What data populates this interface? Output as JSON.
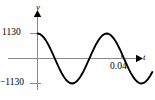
{
  "figure": {
    "name": "sinusoidal-voltage-waveform",
    "background_color": "#ffffff",
    "curve_color": "#000000",
    "axis_color": "#808080",
    "arrow_color": "#000000"
  },
  "labels": {
    "y_axis": "v",
    "x_axis": "t",
    "y_tick_positive": "1130",
    "y_tick_negative": "−1130",
    "x_tick": "0.04"
  },
  "chart_data": {
    "type": "line",
    "title": "",
    "xlabel": "t",
    "ylabel": "v",
    "amplitude": 1130,
    "waveform": "cosine",
    "phase_deg": 0,
    "period": 0.0165,
    "grid": false,
    "legend": null,
    "ylim": [
      -1130,
      1130
    ],
    "xlim": [
      0,
      0.0545
    ],
    "yticks": [
      -1130,
      1130
    ],
    "ytick_labels": [
      "−1130",
      "1130"
    ],
    "xticks": [
      0.04
    ],
    "xtick_labels": [
      "0.04"
    ],
    "cycles_shown": 2.7,
    "x": [
      0.0,
      0.00103,
      0.00206,
      0.00309,
      0.00413,
      0.00516,
      0.00619,
      0.00722,
      0.00825,
      0.00928,
      0.01031,
      0.01134,
      0.01238,
      0.01341,
      0.01444,
      0.01547,
      0.0165,
      0.01753,
      0.01856,
      0.01959,
      0.02063,
      0.02166,
      0.02269,
      0.02372,
      0.02475,
      0.02578,
      0.02681,
      0.02784,
      0.02888,
      0.02991,
      0.03094,
      0.03197,
      0.033,
      0.03403,
      0.03506,
      0.03609,
      0.03713,
      0.03816,
      0.03919,
      0.04022,
      0.04125,
      0.04228,
      0.04331,
      0.04434,
      0.04538,
      0.04641,
      0.04744,
      0.04847,
      0.0495,
      0.05053,
      0.05156,
      0.05259,
      0.05363,
      0.05466
    ],
    "y": [
      1130,
      1108,
      1043,
      938,
      797,
      624,
      428,
      216,
      -4,
      -224,
      -435,
      -631,
      -802,
      -941,
      -1045,
      -1109,
      -1130,
      -1107,
      -1042,
      -936,
      -794,
      -621,
      -424,
      -212,
      9,
      229,
      439,
      635,
      805,
      943,
      1046,
      1110,
      1130,
      1106,
      1040,
      933,
      791,
      617,
      420,
      208,
      -13,
      -233,
      -443,
      -638,
      -808,
      -945,
      -1047,
      -1110,
      -1130,
      -1105,
      -1039,
      -931,
      -788,
      -614
    ]
  }
}
